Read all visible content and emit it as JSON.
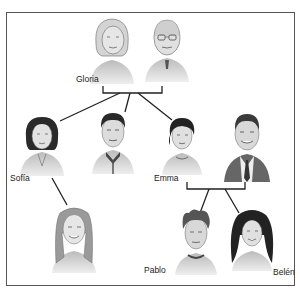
{
  "figure": {
    "type": "family-tree-illustration",
    "labels": {
      "gloria": "Gloria",
      "sofia": "Sofía",
      "emma": "Emma",
      "pablo": "Pablo",
      "belen": "Belén"
    },
    "people": [
      {
        "id": "grandmother",
        "label": "Gloria",
        "generation": 1
      },
      {
        "id": "grandfather",
        "label": "",
        "generation": 1
      },
      {
        "id": "sofia",
        "label": "Sofía",
        "generation": 2
      },
      {
        "id": "son",
        "label": "",
        "generation": 2
      },
      {
        "id": "emma",
        "label": "Emma",
        "generation": 2
      },
      {
        "id": "emma-husband",
        "label": "",
        "generation": 2
      },
      {
        "id": "sofia-daughter",
        "label": "",
        "generation": 3
      },
      {
        "id": "pablo",
        "label": "Pablo",
        "generation": 3
      },
      {
        "id": "belen",
        "label": "Belén",
        "generation": 3
      }
    ],
    "colors": {
      "line": "#222222",
      "frame": "#555555",
      "shade": "#8a8a8a"
    }
  }
}
